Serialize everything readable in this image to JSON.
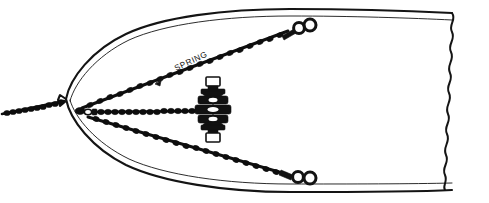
{
  "figure": {
    "background_color": "#ffffff",
    "ink_color": "#111111",
    "width": 489,
    "height": 203
  },
  "labels": [
    {
      "id": "spring",
      "text": "SPRING",
      "x": 176,
      "y": 71,
      "rotation": -25,
      "leader": {
        "from_x": 168,
        "from_y": 76,
        "to_x": 155,
        "to_y": 84,
        "arrow": "down-left-arrow"
      }
    }
  ],
  "hull": {
    "name": "boat-hull-plan-view",
    "orientation": "bow-left",
    "outline_style": "double-line",
    "stem_x": 66,
    "stem_y": 99,
    "break_edge": {
      "name": "torn-break-line",
      "style": "wavy",
      "x": 455,
      "y_top": 14,
      "y_bottom": 191
    }
  },
  "rodes": [
    {
      "id": "anchor-rode",
      "name": "anchor-chain-forward",
      "kind": "chain",
      "from": [
        2,
        114
      ],
      "to": [
        66,
        101
      ],
      "link_count": 11
    },
    {
      "id": "center-run",
      "name": "chain-centerline-run",
      "kind": "chain",
      "from": [
        84,
        113
      ],
      "to": [
        200,
        110
      ],
      "link_count": 17
    },
    {
      "id": "upper-bridle",
      "name": "bridle-leg-upper-spring",
      "kind": "chain",
      "from": [
        80,
        108
      ],
      "to": [
        288,
        30
      ],
      "link_count": 30
    },
    {
      "id": "lower-bridle",
      "name": "bridle-leg-lower",
      "kind": "chain",
      "from": [
        86,
        117
      ],
      "to": [
        286,
        173
      ],
      "link_count": 26
    }
  ],
  "hardware": [
    {
      "id": "bow-shackle",
      "name": "bow-junction-shackle",
      "x": 82,
      "y": 112
    },
    {
      "id": "turnbuckle-stack",
      "name": "turnbuckle-shackle-assembly",
      "x": 213,
      "y": 105,
      "orientation": "vertical",
      "parts": [
        "eye-fitting-top",
        "swivel-upper",
        "turnbuckle-body",
        "swivel-lower",
        "eye-fitting-bottom"
      ]
    },
    {
      "id": "deck-ring-upper",
      "name": "deck-ring-pair-upper",
      "x": 299,
      "y": 27,
      "rings": 2
    },
    {
      "id": "deck-ring-lower",
      "name": "deck-ring-pair-lower",
      "x": 298,
      "y": 176,
      "rings": 2
    }
  ]
}
